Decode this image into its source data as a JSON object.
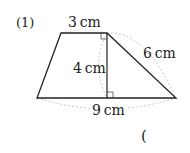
{
  "problem": {
    "number_label": "(1)",
    "answer_paren": "("
  },
  "figure": {
    "type": "trapezoid",
    "labels": {
      "top": "3 cm",
      "height": "4 cm",
      "slant": "6 cm",
      "bottom": "9 cm"
    },
    "colors": {
      "line": "#222222",
      "dashed": "#b0b0b0"
    }
  }
}
